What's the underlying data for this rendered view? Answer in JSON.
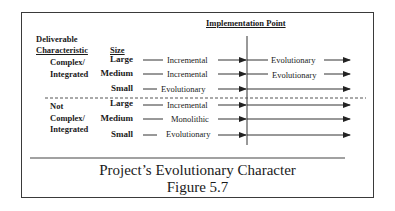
{
  "header": {
    "implementation_point": "Implementation Point",
    "deliverable": "Deliverable",
    "characteristic": "Characteristic",
    "size": "Size"
  },
  "groups": [
    {
      "label_line1": "Complex/",
      "label_line2": "Integrated",
      "rows": [
        {
          "size": "Large",
          "before": "Incremental",
          "after": "Evolutionary"
        },
        {
          "size": "Medium",
          "before": "Incremental",
          "after": "Evolutionary"
        },
        {
          "size": "Small",
          "before": "Evolutionary",
          "after": ""
        }
      ]
    },
    {
      "label_line1": "Not",
      "label_line2": "Complex/",
      "label_line3": "Integrated",
      "rows": [
        {
          "size": "Large",
          "before": "Incremental",
          "after": ""
        },
        {
          "size": "Medium",
          "before": "Monolithic",
          "after": ""
        },
        {
          "size": "Small",
          "before": "Evolutionary",
          "after": ""
        }
      ]
    }
  ],
  "caption": {
    "title": "Project’s Evolutionary Character",
    "figure": "Figure 5.7"
  },
  "colors": {
    "line": "#3a3a3a",
    "text": "#1a1a1a",
    "background": "#ffffff"
  }
}
